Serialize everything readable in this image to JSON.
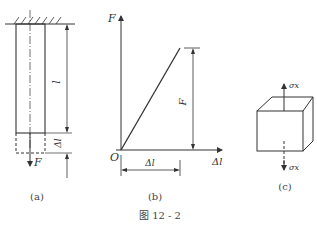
{
  "figure": {
    "caption": "图 12 - 2",
    "panels": [
      {
        "id": "a",
        "label": "(a)",
        "description": "Bar fixed at top wall, elongated by force F",
        "labels": {
          "length": "l",
          "elongation": "Δl",
          "force": "F"
        }
      },
      {
        "id": "b",
        "label": "(b)",
        "description": "Force–elongation linear relation",
        "labels": {
          "y_axis": "F",
          "x_axis": "Δl",
          "origin": "O",
          "force_dim": "F",
          "elong_dim": "Δl"
        }
      },
      {
        "id": "c",
        "label": "(c)",
        "description": "Element under uniaxial normal stress",
        "labels": {
          "stress_top": "σx",
          "stress_bottom": "σx"
        }
      }
    ]
  },
  "colors": {
    "line": "#333333",
    "background": "#ffffff"
  }
}
